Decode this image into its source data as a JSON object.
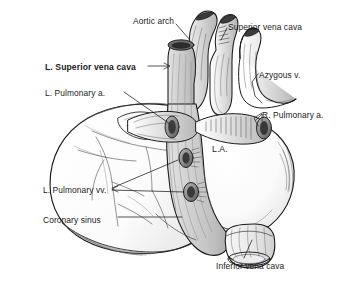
{
  "figure": {
    "background_color": "#ffffff",
    "ink_color": "#1b1b1b",
    "shading_color": "#c9c9c9",
    "width": 346,
    "height": 281
  },
  "labels": [
    {
      "id": "aortic-arch",
      "text": "Aortic arch",
      "x": 133,
      "y": 16,
      "bold": false,
      "align": "left"
    },
    {
      "id": "superior-vena-cava",
      "text": "Superior vena cava",
      "x": 228,
      "y": 22,
      "bold": false,
      "align": "left"
    },
    {
      "id": "l-superior-vena-cava",
      "text": "L. Superior vena cava",
      "x": 45,
      "y": 62,
      "bold": true,
      "align": "left"
    },
    {
      "id": "azygous-v",
      "text": "Azygous v.",
      "x": 259,
      "y": 70,
      "bold": false,
      "align": "left"
    },
    {
      "id": "l-pulmonary-a",
      "text": "L. Pulmonary a.",
      "x": 45,
      "y": 88,
      "bold": false,
      "align": "left"
    },
    {
      "id": "r-pulmonary-a",
      "text": "R. Pulmonary a.",
      "x": 262,
      "y": 110,
      "bold": false,
      "align": "left"
    },
    {
      "id": "left-atrium",
      "text": "L.A.",
      "x": 212,
      "y": 144,
      "bold": false,
      "align": "left"
    },
    {
      "id": "l-pulmonary-vv",
      "text": "L. Pulmonary vv.",
      "x": 43,
      "y": 185,
      "bold": false,
      "align": "left"
    },
    {
      "id": "coronary-sinus",
      "text": "Coronary sinus",
      "x": 43,
      "y": 215,
      "bold": false,
      "align": "left"
    },
    {
      "id": "inferior-vena-cava",
      "text": "Inferior vena cava",
      "x": 216,
      "y": 261,
      "bold": false,
      "align": "left"
    }
  ],
  "structures": [
    {
      "id": "aortic-arch-vessel",
      "name": "Aortic arch"
    },
    {
      "id": "superior-vena-cava-vessel",
      "name": "Superior vena cava"
    },
    {
      "id": "l-superior-vena-cava-vessel",
      "name": "L. Superior vena cava"
    },
    {
      "id": "azygous-vein-vessel",
      "name": "Azygous v."
    },
    {
      "id": "l-pulmonary-artery-vessel",
      "name": "L. Pulmonary a."
    },
    {
      "id": "r-pulmonary-artery-vessel",
      "name": "R. Pulmonary a."
    },
    {
      "id": "left-atrium-body",
      "name": "L.A."
    },
    {
      "id": "l-pulmonary-veins-ostia",
      "name": "L. Pulmonary vv."
    },
    {
      "id": "coronary-sinus-vessel",
      "name": "Coronary sinus"
    },
    {
      "id": "inferior-vena-cava-vessel",
      "name": "Inferior vena cava"
    }
  ]
}
